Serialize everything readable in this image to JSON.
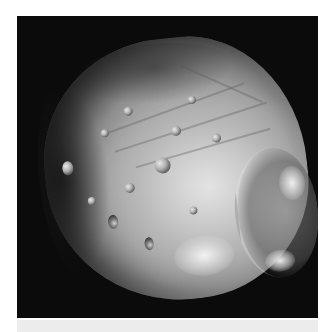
{
  "image": {
    "subject": "Phobos (moon) photograph",
    "description": "Grayscale image of a cratered, irregularly shaped moon against a black background",
    "colors": {
      "background": "#0b0b0b",
      "surface_light": "#e0e0e0",
      "surface_mid": "#9a9a9a",
      "surface_dark": "#3a3a3a",
      "page_background": "#ffffff",
      "bottom_strip": "#ececec"
    },
    "features": [
      {
        "name": "large-crater-right",
        "label": "Large crater on right edge"
      },
      {
        "name": "bright-crater-left",
        "label": "Bright crater on left limb"
      },
      {
        "name": "surface-grooves",
        "label": "Linear grooves across surface"
      }
    ]
  }
}
